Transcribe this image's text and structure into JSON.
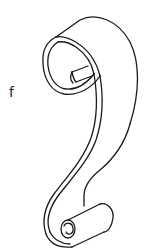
{
  "figure": {
    "panel_label": "f",
    "stroke_color": "#1a1a1a",
    "background_color": "#ffffff"
  }
}
